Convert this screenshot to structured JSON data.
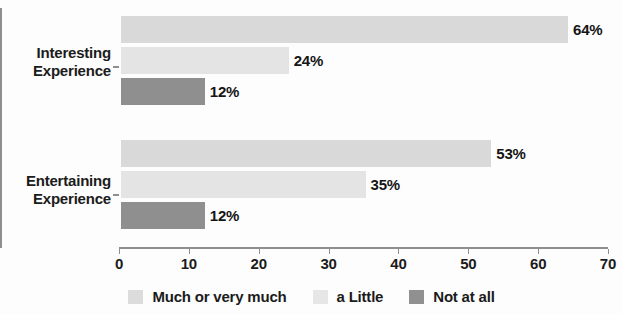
{
  "chart_data": {
    "type": "bar",
    "orientation": "horizontal",
    "title": "",
    "xlabel": "",
    "ylabel": "",
    "categories": [
      "Interesting Experience",
      "Entertaining Experience"
    ],
    "category_lines": [
      [
        "Interesting",
        "Experience"
      ],
      [
        "Entertaining",
        "Experience"
      ]
    ],
    "series": [
      {
        "name": "Much or very much",
        "values": [
          64,
          53
        ],
        "color": "#d9d9d9"
      },
      {
        "name": "a Little",
        "values": [
          24,
          35
        ],
        "color": "#e4e4e4"
      },
      {
        "name": "Not at all",
        "values": [
          12,
          12
        ],
        "color": "#8f8f8f"
      }
    ],
    "data_labels": [
      [
        "64%",
        "24%",
        "12%"
      ],
      [
        "53%",
        "35%",
        "12%"
      ]
    ],
    "xlim": [
      0,
      70
    ],
    "xticks": [
      0,
      10,
      20,
      30,
      40,
      50,
      60,
      70
    ],
    "xtick_labels": [
      "0",
      "10",
      "20",
      "30",
      "40",
      "50",
      "60",
      "70"
    ],
    "grid": false,
    "legend_position": "bottom"
  },
  "legend": {
    "items": [
      {
        "label": "Much or very much",
        "color": "#dcdcdc"
      },
      {
        "label": "a Little",
        "color": "#e6e6e6"
      },
      {
        "label": "Not at all",
        "color": "#909090"
      }
    ]
  }
}
